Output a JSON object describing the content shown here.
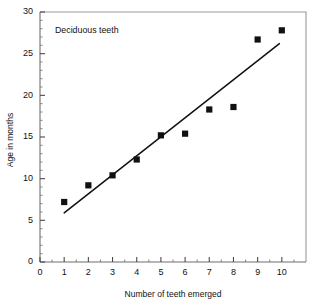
{
  "chart_data": {
    "type": "scatter",
    "title": "Deciduous teeth",
    "xlabel": "Number of teeth emerged",
    "ylabel": "Age in months",
    "xlim": [
      0,
      11
    ],
    "ylim": [
      0,
      30
    ],
    "grid": false,
    "legend": "none",
    "x": [
      1,
      2,
      3,
      4,
      5,
      6,
      7,
      8,
      9,
      10
    ],
    "values": [
      7.2,
      9.2,
      10.4,
      12.3,
      15.2,
      15.4,
      18.3,
      18.6,
      26.7,
      27.8
    ],
    "points": [
      {
        "x": 1,
        "y": 7.2
      },
      {
        "x": 2,
        "y": 9.2
      },
      {
        "x": 3,
        "y": 10.4
      },
      {
        "x": 4,
        "y": 12.3
      },
      {
        "x": 5,
        "y": 15.2
      },
      {
        "x": 6,
        "y": 15.4
      },
      {
        "x": 7,
        "y": 18.3
      },
      {
        "x": 8,
        "y": 18.6
      },
      {
        "x": 9,
        "y": 26.7
      },
      {
        "x": 10,
        "y": 27.8
      }
    ],
    "trend_line": {
      "x0": 1.0,
      "y0": 5.9,
      "x1": 9.9,
      "y1": 26.2
    },
    "xticks": [
      0,
      1,
      2,
      3,
      4,
      5,
      6,
      7,
      8,
      9,
      10
    ],
    "xticklabels": [
      "0",
      "1",
      "2",
      "3",
      "4",
      "5",
      "6",
      "7",
      "8",
      "9",
      "10"
    ],
    "yticks": [
      0,
      5,
      10,
      15,
      20,
      25,
      30
    ],
    "yticklabels": [
      "0",
      "5",
      "10",
      "15",
      "20",
      "25",
      "30"
    ],
    "y_minor_ticks": [
      1,
      2,
      3,
      4,
      6,
      7,
      8,
      9,
      11,
      12,
      13,
      14,
      16,
      17,
      18,
      19,
      21,
      22,
      23,
      24,
      26,
      27,
      28,
      29
    ],
    "x_minor_ticks": [
      0.5,
      1.5,
      2.5,
      3.5,
      4.5,
      5.5,
      6.5,
      7.5,
      8.5,
      9.5,
      10.5
    ],
    "marker_style": "filled-square",
    "marker_color": "#111111",
    "line_color": "#111111"
  }
}
